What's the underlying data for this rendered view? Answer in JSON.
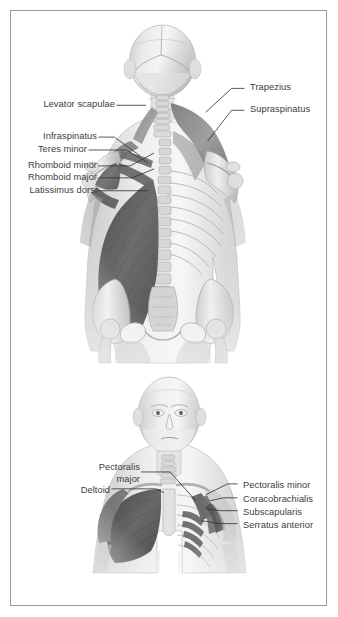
{
  "document": {
    "title": "Muscles of the shoulder and trunk",
    "background_color": "#ffffff",
    "border_color": "#9a9a9a",
    "label_text_color": "#3c3c3c",
    "leader_line_color": "#2e2e2e"
  },
  "figures": [
    {
      "id": "posterior-view",
      "view": "posterior",
      "description": "Posterior view of head, neck, trunk and pelvis showing superficial and deep back muscles on the left side and the skeleton on the right side",
      "labels_left": [
        {
          "text": "Levator scapulae"
        },
        {
          "text": "Infraspinatus"
        },
        {
          "text": "Teres minor"
        },
        {
          "text": "Rhomboid minor"
        },
        {
          "text": "Rhomboid major"
        },
        {
          "text": "Latissimus dorsi"
        }
      ],
      "labels_right": [
        {
          "text": "Trapezius"
        },
        {
          "text": "Supraspinatus"
        }
      ]
    },
    {
      "id": "anterior-view",
      "view": "anterior",
      "description": "Anterior view of head, neck and thorax showing pectoral and deep shoulder muscles",
      "labels_left": [
        {
          "text": "Pectoralis",
          "text2": "major"
        },
        {
          "text": "Deltoid"
        }
      ],
      "labels_right": [
        {
          "text": "Pectoralis minor"
        },
        {
          "text": "Coracobrachialis"
        },
        {
          "text": "Subscapularis"
        },
        {
          "text": "Serratus anterior"
        }
      ]
    }
  ]
}
